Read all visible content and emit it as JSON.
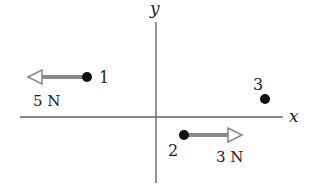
{
  "axes": {
    "x_label": "x",
    "y_label": "y",
    "color": "#666666"
  },
  "particles": [
    {
      "id": "1",
      "label": "1",
      "force_label": "5 N",
      "force_direction": "-x"
    },
    {
      "id": "2",
      "label": "2",
      "force_label": "3 N",
      "force_direction": "+x"
    },
    {
      "id": "3",
      "label": "3",
      "force_label": "",
      "force_direction": "none"
    }
  ],
  "colors": {
    "dot": "#111111",
    "arrow": "#8a8a8a",
    "text": "#222222"
  }
}
